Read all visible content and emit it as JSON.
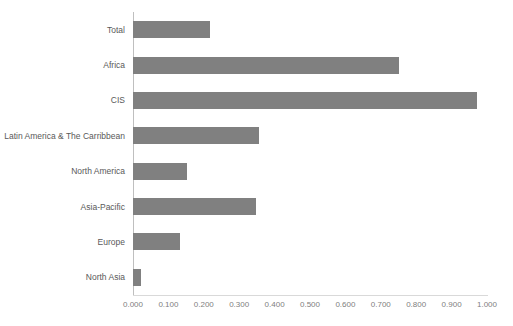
{
  "chart_data": {
    "type": "bar",
    "orientation": "horizontal",
    "title": "",
    "xlabel": "",
    "ylabel": "",
    "xlim": [
      0,
      1.0
    ],
    "grid": false,
    "legend": "none",
    "bar_color": "#808080",
    "axis_color": "#bfbfbf",
    "label_color": "#595959",
    "tick_color": "#808080",
    "categories": [
      "Total",
      "Africa",
      "CIS",
      "Latin America & The Carribbean",
      "North America",
      "Asia-Pacific",
      "Europe",
      "North Asia"
    ],
    "values": [
      0.218,
      0.751,
      0.972,
      0.356,
      0.152,
      0.347,
      0.133,
      0.023
    ],
    "xticks": [
      0.0,
      0.1,
      0.2,
      0.3,
      0.4,
      0.5,
      0.6,
      0.7,
      0.8,
      0.9,
      1.0
    ],
    "xticklabels": [
      "0.000",
      "0.100",
      "0.200",
      "0.300",
      "0.400",
      "0.500",
      "0.600",
      "0.700",
      "0.800",
      "0.900",
      "1.000"
    ]
  }
}
